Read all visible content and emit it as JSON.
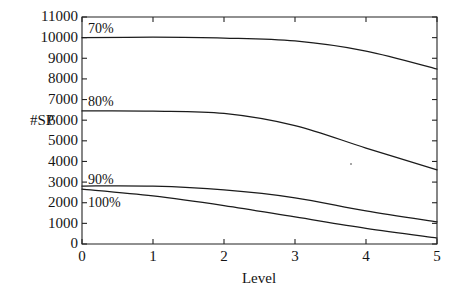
{
  "chart_data": {
    "type": "line",
    "title": "",
    "subtitle": "",
    "xlabel": "Level",
    "ylabel": "#SP",
    "x": [
      0,
      1,
      2,
      3,
      4,
      5
    ],
    "xlim": [
      0,
      5
    ],
    "ylim": [
      0,
      11000
    ],
    "grid": false,
    "legend_position": "inline-left",
    "xtick_labels": [
      "0",
      "1",
      "2",
      "3",
      "4",
      "5"
    ],
    "ytick_labels": [
      "0",
      "1000",
      "2000",
      "3000",
      "4000",
      "5000",
      "6000",
      "7000",
      "8000",
      "9000",
      "10000",
      "11000"
    ],
    "ytick_values": [
      0,
      1000,
      2000,
      3000,
      4000,
      5000,
      6000,
      7000,
      8000,
      9000,
      10000,
      11000
    ],
    "series": [
      {
        "name": "70%",
        "label": "70%",
        "values": [
          10000,
          10020,
          9980,
          9840,
          9350,
          8480
        ]
      },
      {
        "name": "80%",
        "label": "80%",
        "values": [
          6450,
          6440,
          6330,
          5740,
          4650,
          3590
        ]
      },
      {
        "name": "90%",
        "label": "90%",
        "values": [
          2810,
          2800,
          2620,
          2240,
          1600,
          1070
        ]
      },
      {
        "name": "100%",
        "label": "100%",
        "values": [
          2660,
          2330,
          1860,
          1310,
          760,
          290
        ]
      }
    ],
    "axis_color": "#232323",
    "line_color": "#1b1b1b",
    "background_color": "#ffffff"
  },
  "plot": {
    "left": 82,
    "right": 437,
    "top": 17,
    "bottom": 244
  },
  "series_label_positions": [
    {
      "name": "70%",
      "x": 88,
      "y": 33
    },
    {
      "name": "80%",
      "x": 88,
      "y": 106
    },
    {
      "name": "90%",
      "x": 88,
      "y": 184
    },
    {
      "name": "100%",
      "x": 88,
      "y": 207
    }
  ]
}
